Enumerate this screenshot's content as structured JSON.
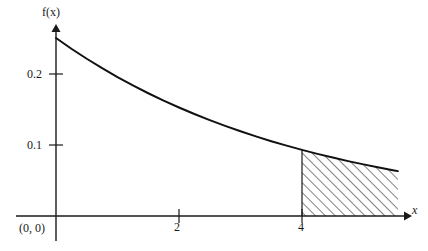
{
  "chart_data": {
    "type": "line",
    "title": "",
    "subtitle": "",
    "xlabel": "x",
    "ylabel": "f(x)",
    "curve_label": "f(x)",
    "xlim": [
      0,
      5.72
    ],
    "ylim": [
      0,
      0.268
    ],
    "grid": false,
    "legend": null,
    "x_ticks": [
      {
        "value": 2,
        "label": "2"
      },
      {
        "value": 4,
        "label": "4"
      }
    ],
    "y_ticks": [
      {
        "value": 0.1,
        "label": "0.1"
      },
      {
        "value": 0.2,
        "label": "0.2"
      }
    ],
    "origin_label": "(0, 0)",
    "function_note": "exponential density, f(x) = 0.25e^(-0.25x)",
    "series": [
      {
        "name": "f(x)",
        "x": [
          0.0,
          0.25,
          0.5,
          0.75,
          1.0,
          1.25,
          1.5,
          1.75,
          2.0,
          2.25,
          2.5,
          2.75,
          3.0,
          3.25,
          3.5,
          3.75,
          4.0,
          4.25,
          4.5,
          4.75,
          5.0,
          5.25,
          5.5,
          5.56
        ],
        "y": [
          0.2507,
          0.2356,
          0.2215,
          0.2082,
          0.1957,
          0.1839,
          0.1729,
          0.1625,
          0.1528,
          0.1436,
          0.135,
          0.1269,
          0.1193,
          0.1121,
          0.1054,
          0.0991,
          0.0931,
          0.0875,
          0.0823,
          0.0773,
          0.0727,
          0.0683,
          0.0642,
          0.0632
        ]
      }
    ],
    "shaded_region": {
      "label": "tail area",
      "x_from": 4,
      "x_to": 5.56,
      "fill": "hatch-45",
      "hatch_spacing_px": 7,
      "boundary_left": true,
      "boundary_bottom": true
    },
    "colors": {
      "curve": "#111111",
      "axis": "#1a1a1a",
      "hatch": "#1a1a1a",
      "background": "#ffffff",
      "text": "#1a1a1a"
    }
  },
  "labels": {
    "y_axis_title": "f(x)",
    "x_axis_title": "x",
    "origin": "(0, 0)",
    "y_tick_02": "0.2",
    "y_tick_01": "0.1",
    "x_tick_2": "2",
    "x_tick_4": "4"
  }
}
